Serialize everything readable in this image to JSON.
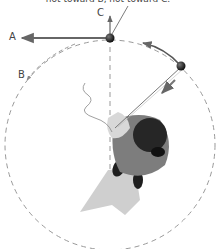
{
  "caption": "not toward B, not toward C.",
  "labels": {
    "a": "A",
    "b": "B",
    "c": "C"
  },
  "colors": {
    "arrow": "#666666",
    "ball": "#2a2a2a",
    "dashed_circle": "#999999",
    "shirt": "#7a7a7a",
    "hair": "#222222",
    "shadow": "#c8c8c8"
  }
}
